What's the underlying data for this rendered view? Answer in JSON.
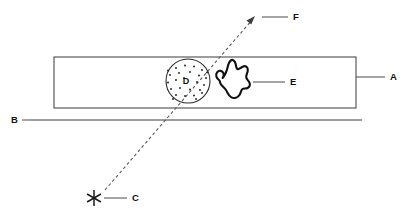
{
  "figure": {
    "title": "",
    "background_color": "#ffffff",
    "line_color": "#3a3a3a",
    "blob_color": "#111111",
    "width": 409,
    "height": 215
  },
  "labels": {
    "a": "A",
    "b": "B",
    "c": "C",
    "d": "D",
    "e": "E",
    "f": "F"
  },
  "elements": {
    "slab": {
      "name": "horizontal-band-rectangle",
      "label_ref": "A",
      "x": 54,
      "y": 57,
      "width": 302,
      "height": 51
    },
    "baseline": {
      "name": "horizontal-baseline",
      "label_ref": "B",
      "x1": 30,
      "x2": 362,
      "y": 120
    },
    "source_star": {
      "name": "source-asterisk",
      "label_ref": "C",
      "cx": 94,
      "cy": 198,
      "radius": 8,
      "ray_count": 6
    },
    "dotted_circle": {
      "name": "speckled-circle-region",
      "label_ref": "D",
      "cx": 188,
      "cy": 81,
      "radius": 22,
      "dot_count": 26
    },
    "blob": {
      "name": "irregular-blob",
      "label_ref": "E",
      "bbox": [
        215,
        59,
        36,
        41
      ]
    },
    "ray": {
      "name": "dashed-ray",
      "label_ref": "F",
      "from": [
        105,
        190
      ],
      "to": [
        255,
        17
      ],
      "style": "dashed",
      "arrow_at": "to"
    }
  },
  "leaders": {
    "a": {
      "from": [
        356,
        77
      ],
      "to": [
        385,
        77
      ]
    },
    "b": {
      "from": [
        30,
        120
      ],
      "to": [
        22,
        120
      ]
    },
    "c": {
      "from": [
        104,
        198
      ],
      "to": [
        127,
        198
      ]
    },
    "e": {
      "from": [
        253,
        82
      ],
      "to": [
        285,
        82
      ]
    },
    "f": {
      "from": [
        262,
        17
      ],
      "to": [
        288,
        17
      ]
    }
  }
}
